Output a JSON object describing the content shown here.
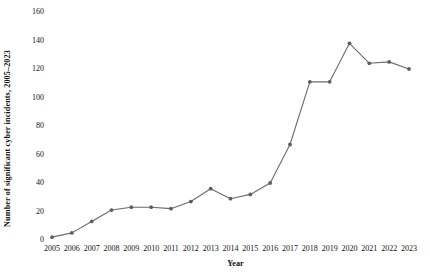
{
  "chart_data": {
    "type": "line",
    "title": "",
    "xlabel": "Year",
    "ylabel": "Number of significant cyber incidents, 2005–2023",
    "categories": [
      "2005",
      "2006",
      "2007",
      "2008",
      "2009",
      "2010",
      "2011",
      "2012",
      "2013",
      "2014",
      "2015",
      "2016",
      "2017",
      "2018",
      "2019",
      "2020",
      "2021",
      "2022",
      "2023"
    ],
    "values": [
      2,
      5,
      13,
      21,
      23,
      23,
      22,
      27,
      36,
      29,
      32,
      40,
      67,
      111,
      111,
      138,
      124,
      125,
      120
    ],
    "series": [
      {
        "name": "Significant cyber incidents",
        "values": [
          2,
          5,
          13,
          21,
          23,
          23,
          22,
          27,
          36,
          29,
          32,
          40,
          67,
          111,
          111,
          138,
          124,
          125,
          120
        ]
      }
    ],
    "x": [
      2005,
      2006,
      2007,
      2008,
      2009,
      2010,
      2011,
      2012,
      2013,
      2014,
      2015,
      2016,
      2017,
      2018,
      2019,
      2020,
      2021,
      2022,
      2023
    ],
    "ylim": [
      0,
      160
    ],
    "yticks": [
      0,
      20,
      40,
      60,
      80,
      100,
      120,
      140,
      160
    ],
    "ytick_labels": [
      "0",
      "20",
      "40",
      "60",
      "80",
      "100",
      "120",
      "140",
      "160"
    ],
    "grid": false,
    "legend": false,
    "legend_position": "none",
    "line_color": "#6b6b6b",
    "marker_color": "#5e5e5e",
    "marker_shape": "circle",
    "background_color": "#ffffff",
    "text_color": "#111111"
  }
}
